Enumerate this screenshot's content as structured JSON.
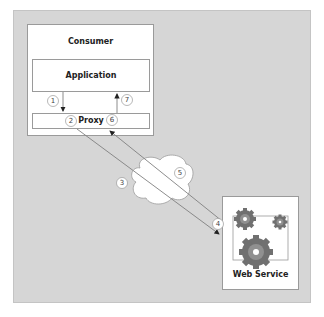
{
  "diagram": {
    "consumer": {
      "title": "Consumer"
    },
    "application": {
      "label": "Application"
    },
    "proxy": {
      "label": "Proxy"
    },
    "web_service": {
      "label": "Web Service",
      "icons": [
        "gear-icon",
        "gear-icon",
        "gear-icon"
      ]
    },
    "cloud": {
      "icon": "cloud-icon"
    },
    "steps": [
      "1",
      "2",
      "3",
      "4",
      "5",
      "6",
      "7"
    ],
    "colors": {
      "panel": "#d6d6d6",
      "box": "#ffffff",
      "line": "#808080",
      "gear": "#707070"
    }
  }
}
